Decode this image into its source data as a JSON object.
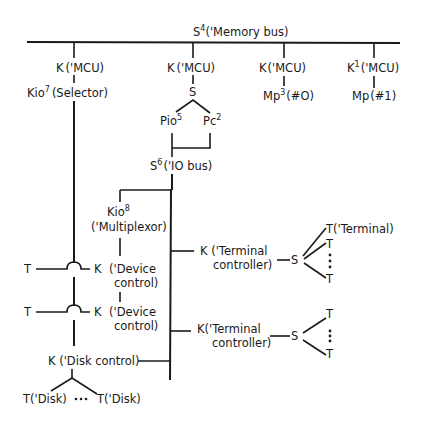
{
  "diagram": {
    "memory_bus": {
      "symbol": "S",
      "sup": "4",
      "label": "('Memory bus)"
    },
    "mcu_branches": [
      {
        "k": "K",
        "k_sup": "",
        "label": "('MCU)",
        "below": "Kio",
        "below_sup": "7",
        "below_label": "(Selector)"
      },
      {
        "k": "K",
        "k_sup": "",
        "label": "('MCU)",
        "below": "S",
        "below_sup": "",
        "below_label": ""
      },
      {
        "k": "K",
        "k_sup": "",
        "label": "('MCU)",
        "below": "Mp",
        "below_sup": "3",
        "below_label": "(#O)"
      },
      {
        "k": "K",
        "k_sup": "1",
        "label": "('MCU)",
        "below": "Mp",
        "below_sup": "",
        "below_label": "(#1)"
      }
    ],
    "processors": [
      {
        "name": "Pio",
        "sup": "5"
      },
      {
        "name": "Pc",
        "sup": "2"
      }
    ],
    "io_bus": {
      "symbol": "S",
      "sup": "6",
      "label": "('IO bus)"
    },
    "multiplexor": {
      "name": "Kio",
      "sup": "8",
      "label": "('Multiplexor)"
    },
    "device_controls": [
      {
        "terminal": "T",
        "k": "K",
        "line1": "('Device",
        "line2": "control)"
      },
      {
        "terminal": "T",
        "k": "K",
        "line1": "('Device",
        "line2": "control)"
      }
    ],
    "terminal_controllers": [
      {
        "line1": "K ('Terminal",
        "line2": "controller)",
        "switch": "S",
        "terminals": [
          "T('Terminal)",
          "T",
          "T"
        ],
        "ellipsis": "⋮"
      },
      {
        "line1": "K('Terminal",
        "line2": "controller)",
        "switch": "S",
        "terminals": [
          "T",
          "T"
        ],
        "ellipsis": "⋮"
      }
    ],
    "disk_control": {
      "label": "K ('Disk control)"
    },
    "disks": {
      "left": "T('Disk)",
      "ellipsis": "•••",
      "right": "T('Disk)"
    }
  }
}
